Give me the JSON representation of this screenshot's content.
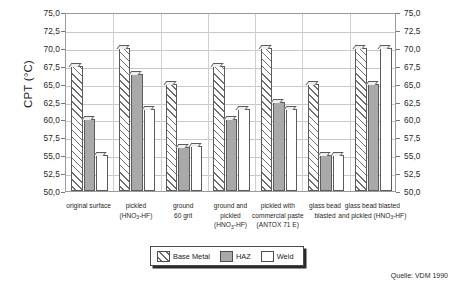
{
  "chart_data": {
    "type": "bar",
    "title": "",
    "xlabel": "",
    "ylabel": "CPT (°C)",
    "ylim": [
      50.0,
      75.0
    ],
    "ytick_step": 2.5,
    "grid": true,
    "legend_position": "bottom-center",
    "ytick_labels": [
      "75,0",
      "72,5",
      "70,0",
      "67,5",
      "65,0",
      "62,5",
      "60,0",
      "57,5",
      "55,0",
      "52,5",
      "50,0"
    ],
    "ytick_values": [
      75.0,
      72.5,
      70.0,
      67.5,
      65.0,
      62.5,
      60.0,
      57.5,
      55.0,
      52.5,
      50.0
    ],
    "categories": [
      "original surface",
      "pickled (HNO3-HF)",
      "ground 60 grit",
      "ground and pickled (HNO3-HF)",
      "pickled with commercial paste (ANTOX 71 E)",
      "glass bead blasted",
      "glass bead blasted and pickled (HNO3-HF)"
    ],
    "category_lines": [
      [
        "original surface"
      ],
      [
        "pickled",
        "(HNO|3|-HF)"
      ],
      [
        "ground",
        "60 grit"
      ],
      [
        "ground and",
        "pickled",
        "(HNO|3|-HF)"
      ],
      [
        "pickled with",
        "commercial paste",
        "(ANTOX 71 E)"
      ],
      [
        "glass bead",
        "blasted"
      ],
      [
        "glass bead blasted",
        "and pickled (HNO|3|-HF)"
      ]
    ],
    "series": [
      {
        "name": "Base Metal",
        "color": "#ffffff",
        "pattern": "diagonal-hatch",
        "values": [
          67.5,
          70.0,
          65.0,
          67.5,
          70.0,
          65.0,
          70.0
        ]
      },
      {
        "name": "HAZ",
        "color": "#a9a9a9",
        "pattern": "solid-gray",
        "values": [
          60.0,
          66.3,
          56.2,
          60.0,
          62.5,
          55.0,
          65.0
        ]
      },
      {
        "name": "Weld",
        "color": "#ffffff",
        "pattern": "solid-white",
        "values": [
          55.0,
          61.5,
          56.3,
          61.5,
          61.5,
          55.0,
          70.0
        ]
      }
    ]
  },
  "legend": {
    "entries": [
      {
        "label": "Base Metal",
        "swatch": "diagonal-hatch-swatch"
      },
      {
        "label": "HAZ",
        "swatch": "gray-swatch"
      },
      {
        "label": "Weld",
        "swatch": "white-swatch"
      }
    ]
  },
  "source_note": "Quelle: VDM 1990"
}
